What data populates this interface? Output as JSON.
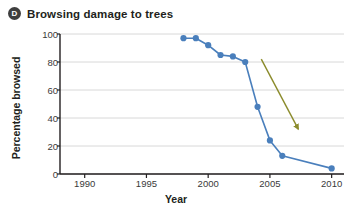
{
  "header": {
    "badge_letter": "D",
    "title": "Browsing damage to trees"
  },
  "chart_data": {
    "type": "line",
    "title": "Browsing damage to trees",
    "xlabel": "Year",
    "ylabel": "Percentage browsed",
    "xlim": [
      1988,
      2011
    ],
    "ylim": [
      0,
      100
    ],
    "xticks": [
      1990,
      1995,
      2000,
      2005,
      2010
    ],
    "yticks": [
      0,
      20,
      40,
      60,
      80,
      100
    ],
    "grid": "horizontal",
    "legend": "none",
    "series": [
      {
        "name": "Percentage browsed",
        "color": "#4a7fbc",
        "marker": "circle",
        "x": [
          1998,
          1999,
          2000,
          2001,
          2002,
          2003,
          2004,
          2005,
          2006,
          2010
        ],
        "values": [
          97,
          97,
          92,
          85,
          84,
          80,
          48,
          24,
          13,
          4
        ]
      }
    ],
    "annotations": [
      {
        "type": "arrow",
        "color": "#8b8b2b",
        "x_start": 2004.3,
        "y_start": 82,
        "x_end": 2007.3,
        "y_end": 32
      }
    ]
  }
}
